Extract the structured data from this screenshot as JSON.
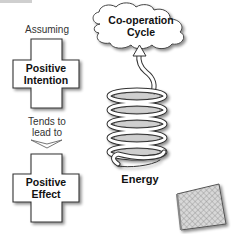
{
  "diagram": {
    "top_fragment": "",
    "left_column": {
      "top_label": "Assuming",
      "top_cross": {
        "line1": "Positive",
        "line2": "Intention"
      },
      "connector_label": {
        "line1": "Tends to",
        "line2": "lead to"
      },
      "connector_icon": "chevron-down-icon",
      "bottom_cross": {
        "line1": "Positive",
        "line2": "Effect"
      }
    },
    "right_column": {
      "cloud": {
        "line1": "Co-operation",
        "line2": "Cycle"
      },
      "spring_label": "Energy",
      "spring_icon": "spring-coil-icon",
      "arrow_icon": "arrow-up-icon",
      "net_icon": "mesh-screen-icon"
    },
    "colors": {
      "outline": "#333333",
      "fill": "#ffffff",
      "shadow": "#b8b8b8",
      "mesh": "#9a9a9a"
    }
  }
}
